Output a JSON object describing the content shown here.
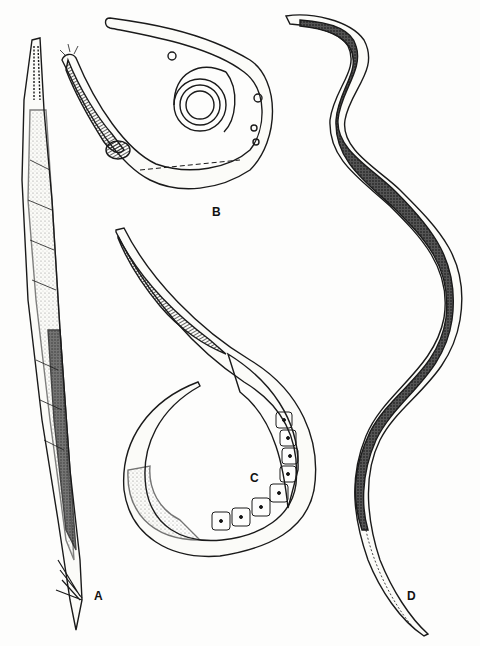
{
  "figure": {
    "panels": [
      {
        "id": "A",
        "label": "A",
        "description": "elongated adult nematode, straight, with spicules at posterior end"
      },
      {
        "id": "B",
        "label": "B",
        "description": "coiled larva with striated esophagus and nuclei"
      },
      {
        "id": "C",
        "label": "C",
        "description": "looped larva with row of intestinal cells"
      },
      {
        "id": "D",
        "label": "D",
        "description": "long sinuous nematode with dark stippled gut and tapering tail"
      }
    ],
    "colors": {
      "ink": "#1a1a1a",
      "paper": "#fdfdfc"
    }
  }
}
